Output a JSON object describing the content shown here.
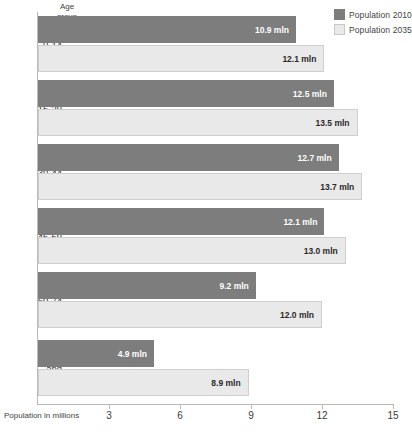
{
  "chart_data": {
    "type": "bar",
    "orientation": "horizontal",
    "title": "",
    "xlabel": "Population in millions",
    "ylabel": "Age group",
    "unit_suffix": "mln",
    "xlim": [
      0,
      15
    ],
    "xticks": [
      3,
      6,
      9,
      12,
      15
    ],
    "grid": false,
    "legend_position": "top-right",
    "categories": [
      "0-14",
      "15-29",
      "30-44",
      "45-59",
      "60-74",
      "75 and over"
    ],
    "series": [
      {
        "name": "Population 2010",
        "color": "#7d7d7d",
        "values": [
          10.9,
          12.5,
          12.7,
          12.1,
          9.2,
          4.9
        ],
        "labels": [
          "10.9 mln",
          "12.5 mln",
          "12.7 mln",
          "12.1 mln",
          "9.2 mln",
          "4.9 mln"
        ]
      },
      {
        "name": "Population 2035",
        "color": "#e9e9e9",
        "values": [
          12.1,
          13.5,
          13.7,
          13.0,
          12.0,
          8.9
        ],
        "labels": [
          "12.1 mln",
          "13.5 mln",
          "13.7 mln",
          "13.0 mln",
          "12.0 mln",
          "8.9 mln"
        ]
      }
    ]
  },
  "legend": {
    "items": [
      {
        "label": "Population 2010"
      },
      {
        "label": "Population 2035"
      }
    ]
  },
  "axis": {
    "y_header_line1": "Age",
    "y_header_line2": "group",
    "x_title": "Population in millions",
    "tick_labels": [
      "3",
      "6",
      "9",
      "12",
      "15"
    ]
  },
  "group_labels": [
    {
      "lines": [
        "0-14"
      ]
    },
    {
      "lines": [
        "15-29"
      ]
    },
    {
      "lines": [
        "30-44"
      ]
    },
    {
      "lines": [
        "45-59"
      ]
    },
    {
      "lines": [
        "60-74"
      ]
    },
    {
      "lines": [
        "75",
        "and",
        "over"
      ]
    }
  ],
  "bar_labels": {
    "g0_2010": "10.9 mln",
    "g0_2035": "12.1 mln",
    "g1_2010": "12.5 mln",
    "g1_2035": "13.5 mln",
    "g2_2010": "12.7 mln",
    "g2_2035": "13.7 mln",
    "g3_2010": "12.1 mln",
    "g3_2035": "13.0 mln",
    "g4_2010": "9.2 mln",
    "g4_2035": "12.0 mln",
    "g5_2010": "4.9 mln",
    "g5_2035": "8.9 mln"
  }
}
